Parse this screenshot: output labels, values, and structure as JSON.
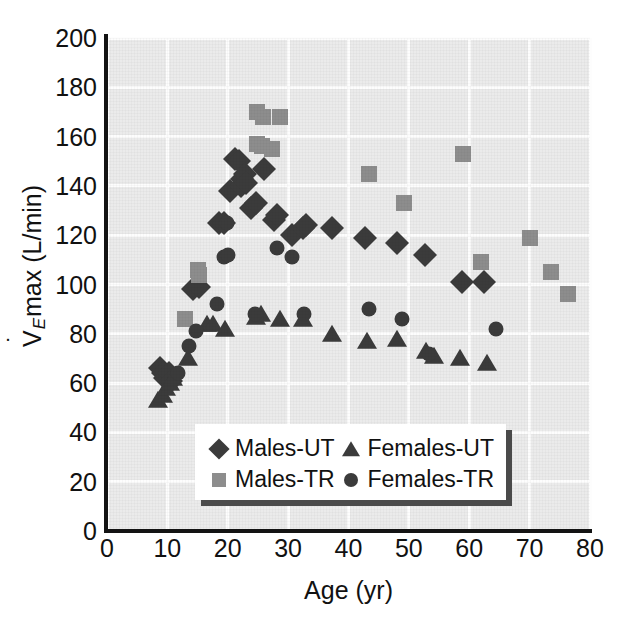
{
  "chart_data": {
    "type": "scatter",
    "title": "",
    "xlabel": "Age (yr)",
    "ylabel": "VEmax (L/min)",
    "ylabel_parts": {
      "v": "V",
      "sub": "E",
      "rest": "max (L/min)"
    },
    "xlim": [
      0,
      80
    ],
    "ylim": [
      0,
      200
    ],
    "xticks": [
      0,
      10,
      20,
      30,
      40,
      50,
      60,
      70,
      80
    ],
    "yticks": [
      0,
      20,
      40,
      60,
      80,
      100,
      120,
      140,
      160,
      180,
      200
    ],
    "grid": true,
    "legend_position": "lower-center-inside",
    "series": [
      {
        "name": "Males-UT",
        "marker": "diamond",
        "color": "#3b3b3b",
        "points": [
          [
            8.8,
            66
          ],
          [
            9.3,
            64
          ],
          [
            9.6,
            62
          ],
          [
            10.2,
            64
          ],
          [
            10.6,
            61
          ],
          [
            14.2,
            98
          ],
          [
            15.3,
            99
          ],
          [
            18.6,
            125
          ],
          [
            19.4,
            125
          ],
          [
            20.4,
            138
          ],
          [
            21.2,
            151
          ],
          [
            21.9,
            150
          ],
          [
            22.4,
            143
          ],
          [
            22.2,
            140
          ],
          [
            22.9,
            145
          ],
          [
            23.1,
            141
          ],
          [
            23.9,
            131
          ],
          [
            24.6,
            133
          ],
          [
            26.0,
            147
          ],
          [
            27.6,
            126
          ],
          [
            28.2,
            128
          ],
          [
            30.7,
            120
          ],
          [
            32.4,
            123
          ],
          [
            33.0,
            124
          ],
          [
            37.3,
            123
          ],
          [
            42.7,
            119
          ],
          [
            48.0,
            117
          ],
          [
            52.7,
            112
          ],
          [
            58.8,
            101
          ],
          [
            62.4,
            101
          ]
        ]
      },
      {
        "name": "Males-TR",
        "marker": "square",
        "color": "#8d8d8d",
        "points": [
          [
            12.9,
            86
          ],
          [
            15.0,
            106
          ],
          [
            15.3,
            104
          ],
          [
            24.9,
            170
          ],
          [
            25.9,
            168
          ],
          [
            28.6,
            168
          ],
          [
            24.9,
            157
          ],
          [
            25.6,
            156
          ],
          [
            27.3,
            155
          ],
          [
            43.4,
            145
          ],
          [
            49.2,
            133
          ],
          [
            58.9,
            153
          ],
          [
            62.0,
            109
          ],
          [
            70.0,
            119
          ],
          [
            73.6,
            105
          ],
          [
            76.4,
            96
          ]
        ]
      },
      {
        "name": "Females-UT",
        "marker": "triangle",
        "color": "#3b3b3b",
        "points": [
          [
            8.5,
            53
          ],
          [
            9.2,
            55
          ],
          [
            9.8,
            58
          ],
          [
            10.4,
            60
          ],
          [
            10.9,
            62
          ],
          [
            13.4,
            70
          ],
          [
            16.6,
            84
          ],
          [
            17.6,
            84
          ],
          [
            19.6,
            82
          ],
          [
            24.6,
            87
          ],
          [
            25.5,
            88
          ],
          [
            28.6,
            86
          ],
          [
            32.4,
            86
          ],
          [
            37.3,
            80
          ],
          [
            43.1,
            77
          ],
          [
            48.0,
            78
          ],
          [
            52.8,
            73
          ],
          [
            54.1,
            71
          ],
          [
            58.5,
            70
          ],
          [
            62.9,
            68
          ]
        ]
      },
      {
        "name": "Females-TR",
        "marker": "circle",
        "color": "#3b3b3b",
        "points": [
          [
            11.8,
            64
          ],
          [
            13.5,
            75
          ],
          [
            14.8,
            81
          ],
          [
            18.3,
            92
          ],
          [
            19.4,
            111
          ],
          [
            20.0,
            112
          ],
          [
            19.9,
            125
          ],
          [
            24.5,
            88
          ],
          [
            28.2,
            115
          ],
          [
            30.6,
            111
          ],
          [
            32.6,
            88
          ],
          [
            43.4,
            90
          ],
          [
            48.8,
            86
          ],
          [
            53.3,
            72
          ],
          [
            64.5,
            82
          ]
        ]
      }
    ]
  },
  "legend": {
    "entries": [
      {
        "label": "Males-UT",
        "marker": "diamond",
        "color": "#3b3b3b"
      },
      {
        "label": "Females-UT",
        "marker": "triangle",
        "color": "#3b3b3b"
      },
      {
        "label": "Males-TR",
        "marker": "square",
        "color": "#8d8d8d"
      },
      {
        "label": "Females-TR",
        "marker": "circle",
        "color": "#3b3b3b"
      }
    ]
  },
  "axes": {
    "y_tick_labels": [
      "200",
      "180",
      "160",
      "140",
      "120",
      "100",
      "80",
      "60",
      "40",
      "20",
      "0"
    ],
    "x_tick_labels": [
      "0",
      "10",
      "20",
      "30",
      "40",
      "50",
      "60",
      "70",
      "80"
    ],
    "x_title": "Age (yr)"
  },
  "colors": {
    "plot_background": "#ebebeb",
    "gridline": "#fdfdfd",
    "axis": "#131313",
    "dark_marker": "#3b3b3b",
    "gray_marker": "#8d8d8d"
  }
}
